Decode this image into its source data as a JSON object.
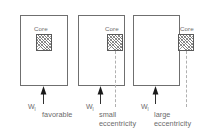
{
  "diagram": {
    "panels": [
      {
        "core_label": "Core",
        "load_symbol": "W",
        "load_subscript": "l",
        "caption_line1": "favorable",
        "caption_line2": "",
        "eccentricity": "none"
      },
      {
        "core_label": "Core",
        "load_symbol": "W",
        "load_subscript": "l",
        "caption_line1": "small",
        "caption_line2": "eccentricity",
        "eccentricity": "small"
      },
      {
        "core_label": "Core",
        "load_symbol": "W",
        "load_subscript": "l",
        "caption_line1": "large",
        "caption_line2": "eccentricity",
        "eccentricity": "large"
      }
    ],
    "colors": {
      "outline": "#6f6f6f",
      "text": "#6b6b6b",
      "hatch": "#7c7c7c",
      "dashed": "#b0b0b0",
      "arrow": "#1a1a1a",
      "background": "#ffffff"
    }
  }
}
